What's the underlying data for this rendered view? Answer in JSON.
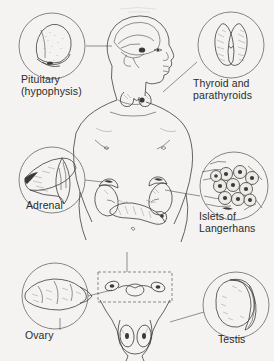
{
  "diagram": {
    "background_color": "#f4f3f1",
    "ink_color": "#2b2b2b",
    "central_subject": "human-body-figure",
    "callouts": [
      {
        "id": "pituitary",
        "label_line1": "Pituitary",
        "label_line2": "(hypophysis)",
        "inset": "pituitary-gland-sagittal-section",
        "position": "top-left",
        "connects_to": "brain-sella-turcica"
      },
      {
        "id": "thyroid",
        "label_line1": "Thyroid and",
        "label_line2": "parathyroids",
        "inset": "thyroid-gland-butterfly-lobes",
        "position": "top-right",
        "connects_to": "neck-below-larynx"
      },
      {
        "id": "adrenal",
        "label_line1": "Adrenal",
        "label_line2": "",
        "inset": "adrenal-gland-cross-section",
        "position": "middle-left",
        "connects_to": "superior-pole-of-kidney"
      },
      {
        "id": "islets",
        "label_line1": "Islets of",
        "label_line2": "Langerhans",
        "inset": "pancreatic-islet-cells-micrograph",
        "position": "middle-right",
        "connects_to": "pancreas"
      },
      {
        "id": "ovary",
        "label_line1": "Ovary",
        "label_line2": "",
        "inset": "ovary-lobulated-surface",
        "position": "bottom-left",
        "connects_to": "pelvic-dashed-inset-box"
      },
      {
        "id": "testis",
        "label_line1": "Testis",
        "label_line2": "",
        "inset": "testis-with-epididymis",
        "position": "bottom-right",
        "connects_to": "scrotum"
      }
    ],
    "body_structures": [
      "head-profile-facing-right",
      "brain-sagittal-section",
      "thyroid-in-neck",
      "torso-front",
      "kidneys-with-adrenals",
      "pancreas",
      "uterus-and-ovaries-in-dashed-box",
      "testes-in-scrotum"
    ]
  }
}
